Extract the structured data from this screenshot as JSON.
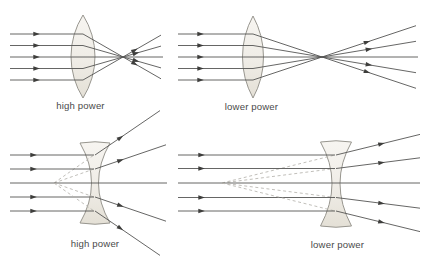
{
  "figure": {
    "kind": "lens-power-ray-diagram",
    "rows": [
      {
        "lens_type": "converging convex lens",
        "comparison": "short focal length vs long focal length"
      },
      {
        "lens_type": "diverging concave lens",
        "comparison": "short virtual focal length vs long virtual focal length"
      }
    ]
  },
  "panels": [
    {
      "id": "top-left",
      "lens": "convex-converging",
      "label": "high power",
      "focal_length": "short"
    },
    {
      "id": "top-right",
      "lens": "convex-converging",
      "label": "lower power",
      "focal_length": "long"
    },
    {
      "id": "bottom-left",
      "lens": "concave-diverging",
      "label": "high power",
      "focal_length": "short"
    },
    {
      "id": "bottom-right",
      "lens": "concave-diverging",
      "label": "lower power",
      "focal_length": "long"
    }
  ],
  "colors": {
    "background": "#ffffff",
    "ray": "#555553",
    "arrowhead": "#3e3e3c",
    "lens_stroke": "#98968f",
    "lens_fill_top": "#f7f5f1",
    "lens_fill_mid": "#efece6",
    "lens_fill_bottom": "#e4e0d6",
    "dashed_ray": "#b6b4ae",
    "label": "#4a4a4a"
  }
}
